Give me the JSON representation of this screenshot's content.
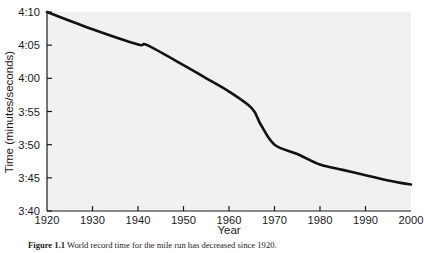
{
  "figure": {
    "caption_label": "Figure 1.1",
    "caption_text": "World record time for the mile run has decreased since 1920."
  },
  "chart_data": {
    "type": "line",
    "title": "",
    "xlabel": "Year",
    "ylabel": "Time (minutes/seconds)",
    "xlim": [
      1920,
      2000
    ],
    "ylim": [
      220,
      250
    ],
    "grid": false,
    "legend": null,
    "xticks": [
      1920,
      1930,
      1940,
      1950,
      1960,
      1970,
      1980,
      1990,
      2000
    ],
    "xticklabels": [
      "1920",
      "1930",
      "1940",
      "1950",
      "1960",
      "1970",
      "1980",
      "1990",
      "2000"
    ],
    "yticks": [
      220,
      225,
      230,
      235,
      240,
      245,
      250
    ],
    "yticklabels": [
      "3:40",
      "3:45",
      "3:50",
      "3:55",
      "4:00",
      "4:05",
      "4:10"
    ],
    "series": [
      {
        "name": "World record mile time",
        "color": "#111111",
        "x": [
          1920,
          1930,
          1940,
          1942,
          1950,
          1955,
          1960,
          1965,
          1967,
          1970,
          1975,
          1980,
          1985,
          1990,
          1995,
          1998,
          2000
        ],
        "y": [
          250,
          247.4,
          245.1,
          245.0,
          242.0,
          240.0,
          238.0,
          235.5,
          233.0,
          230.0,
          228.6,
          227.0,
          226.2,
          225.4,
          224.6,
          224.2,
          224.0
        ],
        "y_labels": [
          "4:10",
          "4:07.4",
          "4:05.1",
          "4:05.0",
          "4:02.0",
          "4:00.0",
          "3:58.0",
          "3:55.5",
          "3:53.0",
          "3:50.0",
          "3:48.6",
          "3:47.0",
          "3:46.2",
          "3:45.4",
          "3:44.6",
          "3:44.2",
          "3:44.0"
        ]
      }
    ],
    "plot_bg": "#f1f1f1",
    "axis_color": "#1a1a1a",
    "line_width": 2.6
  }
}
